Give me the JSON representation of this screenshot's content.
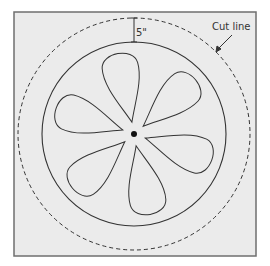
{
  "diagram": {
    "title": "",
    "labels": {
      "measurement": "5\"",
      "cut_line": "Cut line"
    },
    "colors": {
      "background": "#ebebeb",
      "border": "#6f6f6f",
      "stroke": "#333333",
      "page": "#ffffff"
    },
    "shapes": {
      "outer_dashed_circle": {
        "cx": 134,
        "cy": 134,
        "r": 116,
        "style": "dashed"
      },
      "inner_solid_circle": {
        "cx": 134,
        "cy": 134,
        "r": 92,
        "style": "solid"
      },
      "center_dot": {
        "cx": 134,
        "cy": 134,
        "r": 3
      },
      "petal_count": 6
    }
  }
}
